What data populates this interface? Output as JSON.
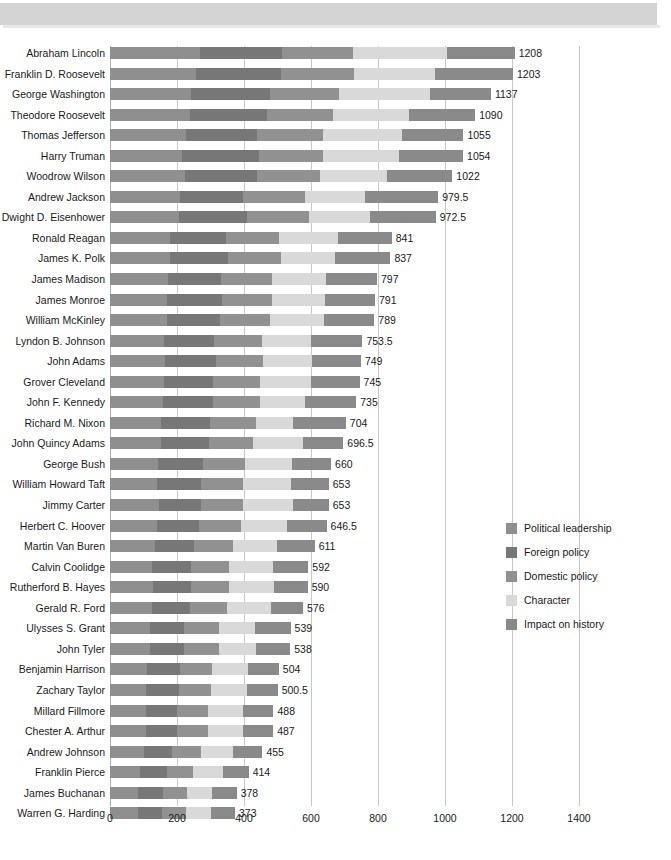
{
  "chart_data": {
    "type": "bar",
    "subtype": "stacked-horizontal",
    "title": "",
    "xlabel": "",
    "ylabel": "",
    "xlim": [
      0,
      1400
    ],
    "xticks": [
      0,
      200,
      400,
      600,
      800,
      1000,
      1200,
      1400
    ],
    "grid": true,
    "legend_position": "right-middle",
    "categories": [
      "Abraham Lincoln",
      "Franklin D. Roosevelt",
      "George Washington",
      "Theodore Roosevelt",
      "Thomas Jefferson",
      "Harry Truman",
      "Woodrow Wilson",
      "Andrew Jackson",
      "Dwight D. Eisenhower",
      "Ronald Reagan",
      "James K. Polk",
      "James Madison",
      "James Monroe",
      "William McKinley",
      "Lyndon B. Johnson",
      "John Adams",
      "Grover Cleveland",
      "John F. Kennedy",
      "Richard M. Nixon",
      "John Quincy Adams",
      "George Bush",
      "William Howard Taft",
      "Jimmy Carter",
      "Herbert C. Hoover",
      "Martin Van Buren",
      "Calvin Coolidge",
      "Rutherford B. Hayes",
      "Gerald R. Ford",
      "Ulysses S. Grant",
      "John Tyler",
      "Benjamin Harrison",
      "Zachary Taylor",
      "Millard Fillmore",
      "Chester A. Arthur",
      "Andrew Johnson",
      "Franklin Pierce",
      "James Buchanan",
      "Warren G. Harding"
    ],
    "totals": [
      1208,
      1203,
      1137,
      1090,
      1055,
      1054,
      1022,
      979.5,
      972.5,
      841,
      837,
      797,
      791,
      789,
      753.5,
      749,
      745,
      735,
      704,
      696.5,
      660,
      653,
      653,
      646.5,
      611,
      592,
      590,
      576,
      539,
      538,
      504,
      500.5,
      488,
      487,
      455,
      414,
      378,
      373
    ],
    "total_labels": [
      "1208",
      "1203",
      "1137",
      "1090",
      "1055",
      "1054",
      "1022",
      "979.5",
      "972.5",
      "841",
      "837",
      "797",
      "791",
      "789",
      "753.5",
      "749",
      "745",
      "735",
      "704",
      "696.5",
      "660",
      "653",
      "653",
      "646.5",
      "611",
      "592",
      "590",
      "576",
      "539",
      "538",
      "504",
      "500.5",
      "488",
      "487",
      "455",
      "414",
      "378",
      "373"
    ],
    "series": [
      {
        "name": "Political leadership",
        "color": "#8f8f8f",
        "values": [
          268,
          258,
          243,
          240,
          228,
          215,
          225,
          208,
          207,
          180,
          180,
          172,
          171,
          170,
          162,
          164,
          160,
          158,
          152,
          152,
          143,
          141,
          145,
          140,
          133,
          126,
          128,
          126,
          118,
          118,
          110,
          108,
          106,
          106,
          100,
          91,
          83,
          83
        ]
      },
      {
        "name": "Foreign policy",
        "color": "#777777",
        "values": [
          246,
          252,
          235,
          228,
          212,
          230,
          214,
          188,
          203,
          167,
          172,
          160,
          162,
          158,
          149,
          152,
          146,
          150,
          148,
          144,
          134,
          132,
          127,
          126,
          119,
          116,
          114,
          114,
          104,
          103,
          98,
          99,
          93,
          93,
          86,
          78,
          74,
          71
        ]
      },
      {
        "name": "Domestic policy",
        "color": "#919191",
        "values": [
          211,
          218,
          206,
          199,
          196,
          192,
          188,
          185,
          183,
          157,
          159,
          152,
          150,
          151,
          144,
          140,
          143,
          139,
          135,
          131,
          127,
          124,
          124,
          124,
          116,
          113,
          112,
          109,
          104,
          103,
          97,
          96,
          94,
          93,
          87,
          80,
          73,
          72
        ]
      },
      {
        "name": "Character",
        "color": "#d9d9d9",
        "values": [
          281,
          241,
          272,
          227,
          236,
          226,
          200,
          180,
          184,
          177,
          160,
          161,
          158,
          160,
          144,
          148,
          152,
          136,
          112,
          149,
          140,
          143,
          150,
          137,
          132,
          131,
          135,
          133,
          108,
          111,
          106,
          105,
          104,
          104,
          94,
          88,
          76,
          77
        ]
      },
      {
        "name": "Impact on history",
        "color": "#8a8a8a",
        "values": [
          202,
          234,
          181,
          196,
          183,
          191,
          195,
          218.5,
          195.5,
          160,
          166,
          152,
          150,
          150,
          154.5,
          145,
          144,
          152,
          157,
          120.5,
          116,
          113,
          107,
          119.5,
          111,
          106,
          101,
          94,
          105,
          103,
          93,
          92.5,
          91,
          91,
          88,
          77,
          72,
          70
        ]
      }
    ]
  },
  "legend": {
    "items": [
      {
        "label": "Political leadership",
        "color": "#8f8f8f"
      },
      {
        "label": "Foreign policy",
        "color": "#777777"
      },
      {
        "label": "Domestic policy",
        "color": "#919191"
      },
      {
        "label": "Character",
        "color": "#d9d9d9"
      },
      {
        "label": "Impact on history",
        "color": "#8a8a8a"
      }
    ]
  }
}
